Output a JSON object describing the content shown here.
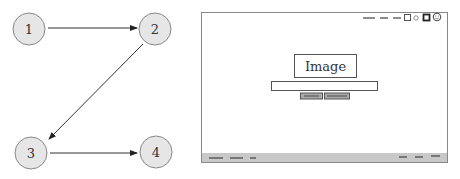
{
  "flow_diagram": {
    "nodes": [
      {
        "id": "1",
        "label": "1"
      },
      {
        "id": "2",
        "label": "2"
      },
      {
        "id": "3",
        "label": "3"
      },
      {
        "id": "4",
        "label": "4"
      }
    ],
    "edges": [
      {
        "from": "1",
        "to": "2"
      },
      {
        "from": "2",
        "to": "3"
      },
      {
        "from": "3",
        "to": "4"
      }
    ],
    "node_fill": "#e6e6e6",
    "node_stroke": "#888888",
    "edge_color": "#333333"
  },
  "wireframe": {
    "image_placeholder_label": "Image",
    "window_controls": [
      "minimize-dash",
      "minimize-dash",
      "minimize-dash",
      "square-icon",
      "circle-icon",
      "filled-square-icon",
      "smiley-icon"
    ],
    "status_bar_color": "#c8c8c8",
    "frame_stroke": "#888888"
  }
}
